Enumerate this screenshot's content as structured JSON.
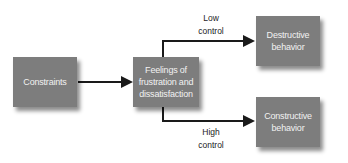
{
  "diagram": {
    "type": "flowchart",
    "nodes": {
      "constraints": {
        "label": "Constraints"
      },
      "feelings": {
        "line1": "Feelings of",
        "line2": "frustration and",
        "line3": "dissatisfaction"
      },
      "destructive": {
        "line1": "Destructive",
        "line2": "behavior"
      },
      "constructive": {
        "line1": "Constructive",
        "line2": "behavior"
      }
    },
    "edges": [
      {
        "from": "constraints",
        "to": "feelings",
        "label": ""
      },
      {
        "from": "feelings",
        "to": "destructive",
        "label": "Low control"
      },
      {
        "from": "feelings",
        "to": "constructive",
        "label": "High control"
      }
    ],
    "edge_labels": {
      "low": {
        "line1": "Low",
        "line2": "control"
      },
      "high": {
        "line1": "High",
        "line2": "control"
      }
    },
    "colors": {
      "box_fill": "#7d7d7d",
      "box_text": "#f2f2f2",
      "line": "#1a1a1a",
      "background": "#ffffff"
    }
  }
}
